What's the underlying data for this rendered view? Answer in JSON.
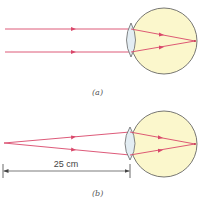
{
  "figure": {
    "panels": [
      {
        "id": "a",
        "caption": "(a)",
        "description": "Parallel rays from a distant object focused on the retina",
        "eye": {
          "cx": 164,
          "cy": 41,
          "r": 33
        },
        "rays": [
          "upper",
          "lower"
        ]
      },
      {
        "id": "b",
        "caption": "(b)",
        "description": "Diverging rays from a near point object focused on the retina",
        "eye": {
          "cx": 164,
          "cy": 144,
          "r": 33
        },
        "dimension_label": "25 cm"
      }
    ],
    "colors": {
      "ray": "#d9476a",
      "eye_fill": "#fbf7cc",
      "eye_outline": "#555555",
      "lens_fill": "#e3edf3",
      "dimension_line": "#444444"
    }
  }
}
